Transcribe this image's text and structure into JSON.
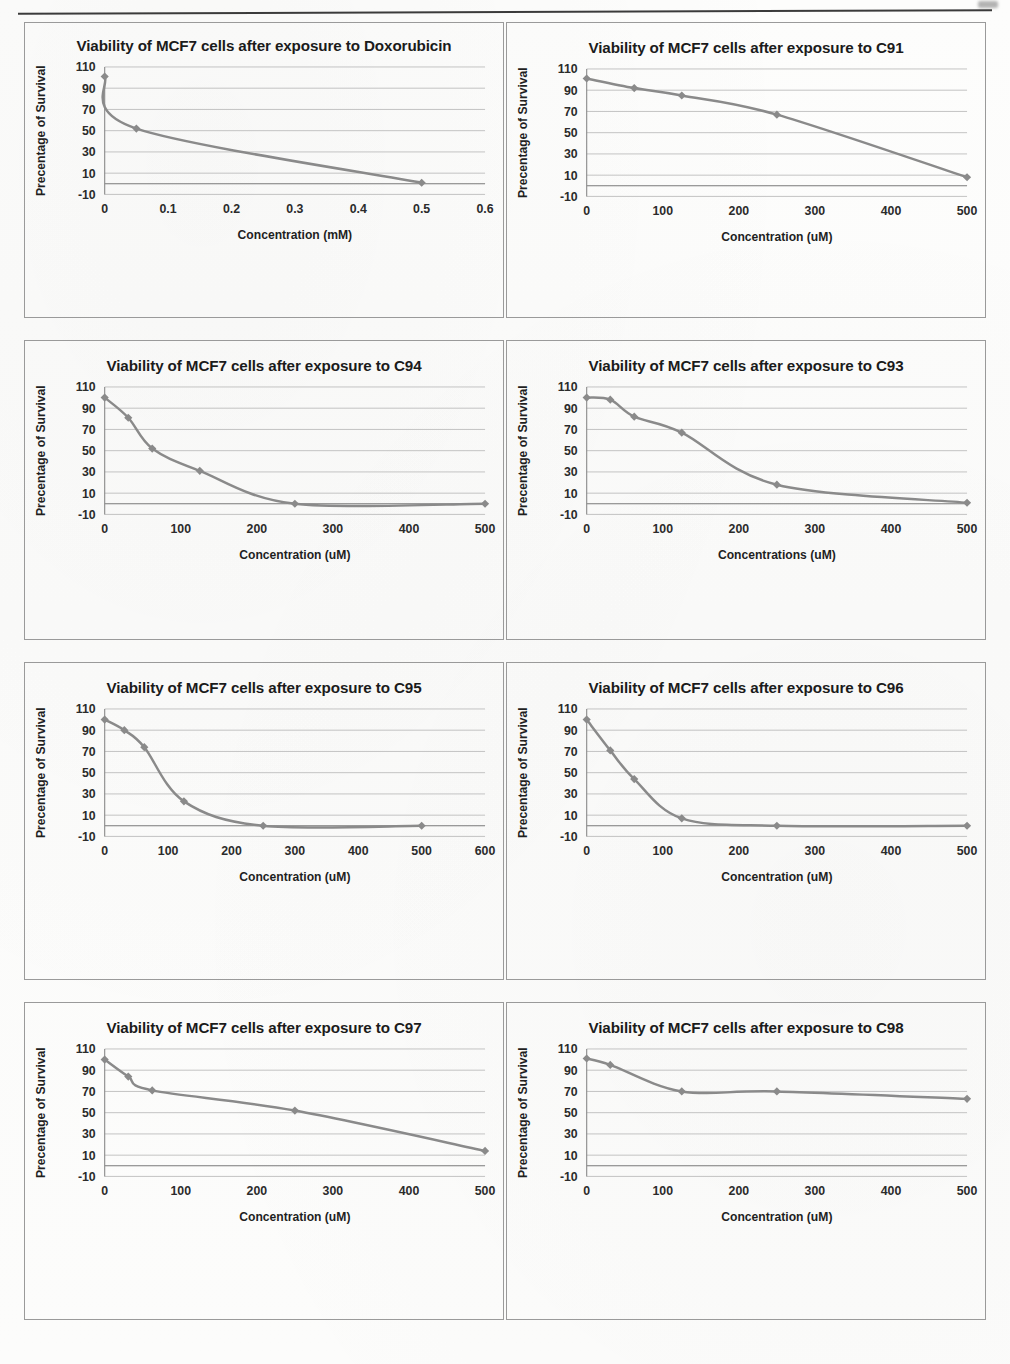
{
  "page": {
    "y_axis_label": "Precentage of Survival",
    "y_ticks": [
      -10,
      10,
      30,
      50,
      70,
      90,
      110
    ],
    "accent_color": "#8a8a8a",
    "gridline_color": "#b9b9b9",
    "text_color": "#1b1b1b"
  },
  "chart_data": [
    {
      "id": "doxorubicin",
      "type": "line",
      "title": "Viability of MCF7 cells after exposure to Doxorubicin",
      "xlabel": "Concentration (mM)",
      "ylabel": "Precentage of Survival",
      "xlim": [
        0,
        0.6
      ],
      "ylim": [
        -10,
        110
      ],
      "x_ticks": [
        0,
        0.1,
        0.2,
        0.3,
        0.4,
        0.5,
        0.6
      ],
      "x_tick_labels": [
        "0",
        "0.1",
        "0.2",
        "0.3",
        "0.4",
        "0.5",
        "0.6"
      ],
      "y_ticks": [
        -10,
        10,
        30,
        50,
        70,
        90,
        110
      ],
      "grid": true,
      "legend": "none",
      "x": [
        0,
        0.05,
        0.5
      ],
      "values": [
        101,
        52,
        1
      ]
    },
    {
      "id": "c91",
      "type": "line",
      "title": "Viability of MCF7 cells after exposure to C91",
      "xlabel": "Concentration (uM)",
      "ylabel": "Precentage of Survival",
      "xlim": [
        0,
        500
      ],
      "ylim": [
        -10,
        110
      ],
      "x_ticks": [
        0,
        100,
        200,
        300,
        400,
        500
      ],
      "x_tick_labels": [
        "0",
        "100",
        "200",
        "300",
        "400",
        "500"
      ],
      "y_ticks": [
        -10,
        10,
        30,
        50,
        70,
        90,
        110
      ],
      "grid": true,
      "legend": "none",
      "x": [
        0,
        62.5,
        125,
        250,
        500
      ],
      "values": [
        101,
        92,
        85,
        67,
        8
      ]
    },
    {
      "id": "c94",
      "type": "line",
      "title": "Viability of MCF7 cells after exposure to C94",
      "xlabel": "Concentration (uM)",
      "ylabel": "Precentage of Survival",
      "xlim": [
        0,
        500
      ],
      "ylim": [
        -10,
        110
      ],
      "x_ticks": [
        0,
        100,
        200,
        300,
        400,
        500
      ],
      "x_tick_labels": [
        "0",
        "100",
        "200",
        "300",
        "400",
        "500"
      ],
      "y_ticks": [
        -10,
        10,
        30,
        50,
        70,
        90,
        110
      ],
      "grid": true,
      "legend": "none",
      "x": [
        0,
        31,
        62.5,
        125,
        250,
        500
      ],
      "values": [
        100,
        81,
        52,
        31,
        0,
        0
      ]
    },
    {
      "id": "c93",
      "type": "line",
      "title": "Viability of MCF7 cells after exposure to C93",
      "xlabel": "Concentrations (uM)",
      "ylabel": "Precentage of Survival",
      "xlim": [
        0,
        500
      ],
      "ylim": [
        -10,
        110
      ],
      "x_ticks": [
        0,
        100,
        200,
        300,
        400,
        500
      ],
      "x_tick_labels": [
        "0",
        "100",
        "200",
        "300",
        "400",
        "500"
      ],
      "y_ticks": [
        -10,
        10,
        30,
        50,
        70,
        90,
        110
      ],
      "grid": true,
      "legend": "none",
      "x": [
        0,
        31,
        62.5,
        125,
        250,
        500
      ],
      "values": [
        100,
        98,
        82,
        67,
        18,
        1
      ]
    },
    {
      "id": "c95",
      "type": "line",
      "title": "Viability of MCF7 cells after exposure to C95",
      "xlabel": "Concentration (uM)",
      "ylabel": "Precentage of Survival",
      "xlim": [
        0,
        600
      ],
      "ylim": [
        -10,
        110
      ],
      "x_ticks": [
        0,
        100,
        200,
        300,
        400,
        500,
        600
      ],
      "x_tick_labels": [
        "0",
        "100",
        "200",
        "300",
        "400",
        "500",
        "600"
      ],
      "y_ticks": [
        -10,
        10,
        30,
        50,
        70,
        90,
        110
      ],
      "grid": true,
      "legend": "none",
      "x": [
        0,
        31,
        62.5,
        125,
        250,
        500
      ],
      "values": [
        100,
        90,
        74,
        23,
        0,
        0
      ]
    },
    {
      "id": "c96",
      "type": "line",
      "title": "Viability of MCF7 cells after exposure to C96",
      "xlabel": "Concentration (uM)",
      "ylabel": "Precentage of Survival",
      "xlim": [
        0,
        500
      ],
      "ylim": [
        -10,
        110
      ],
      "x_ticks": [
        0,
        100,
        200,
        300,
        400,
        500
      ],
      "x_tick_labels": [
        "0",
        "100",
        "200",
        "300",
        "400",
        "500"
      ],
      "y_ticks": [
        -10,
        10,
        30,
        50,
        70,
        90,
        110
      ],
      "grid": true,
      "legend": "none",
      "x": [
        0,
        31,
        62.5,
        125,
        250,
        500
      ],
      "values": [
        100,
        71,
        44,
        7,
        0,
        0
      ]
    },
    {
      "id": "c97",
      "type": "line",
      "title": "Viability of MCF7 cells after exposure to C97",
      "xlabel": "Concentration (uM)",
      "ylabel": "Precentage of Survival",
      "xlim": [
        0,
        500
      ],
      "ylim": [
        -10,
        110
      ],
      "x_ticks": [
        0,
        100,
        200,
        300,
        400,
        500
      ],
      "x_tick_labels": [
        "0",
        "100",
        "200",
        "300",
        "400",
        "500"
      ],
      "y_ticks": [
        -10,
        10,
        30,
        50,
        70,
        90,
        110
      ],
      "grid": true,
      "legend": "none",
      "x": [
        0,
        31,
        62.5,
        250,
        500
      ],
      "values": [
        100,
        84,
        71,
        52,
        14
      ]
    },
    {
      "id": "c98",
      "type": "line",
      "title": "Viability of MCF7 cells after exposure to C98",
      "xlabel": "Concentration (uM)",
      "ylabel": "Precentage of Survival",
      "xlim": [
        0,
        500
      ],
      "ylim": [
        -10,
        110
      ],
      "x_ticks": [
        0,
        100,
        200,
        300,
        400,
        500
      ],
      "x_tick_labels": [
        "0",
        "100",
        "200",
        "300",
        "400",
        "500"
      ],
      "y_ticks": [
        -10,
        10,
        30,
        50,
        70,
        90,
        110
      ],
      "grid": true,
      "legend": "none",
      "x": [
        0,
        31,
        125,
        250,
        500
      ],
      "values": [
        101,
        95,
        70,
        70,
        63
      ]
    }
  ]
}
